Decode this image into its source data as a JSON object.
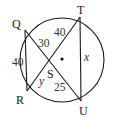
{
  "diagram": {
    "type": "circle-intersecting-chords",
    "circle": {
      "cx": 62,
      "cy": 60,
      "r": 42
    },
    "center_dot": {
      "x": 62,
      "y": 59
    },
    "points": {
      "Q": {
        "label": "Q",
        "x": 25,
        "y": 30
      },
      "T": {
        "label": "T",
        "x": 80,
        "y": 17
      },
      "R": {
        "label": "R",
        "x": 27,
        "y": 91
      },
      "U": {
        "label": "U",
        "x": 81,
        "y": 101
      },
      "S": {
        "label": "S",
        "x": 50,
        "y": 59
      }
    },
    "segments": [
      {
        "from": "Q",
        "to": "U"
      },
      {
        "from": "R",
        "to": "T"
      },
      {
        "from": "Q",
        "to": "R"
      },
      {
        "from": "T",
        "to": "U"
      }
    ],
    "measures": {
      "QR": "40",
      "QS": "30",
      "ST": "40",
      "TU": "x",
      "RS": "y",
      "SU": "25"
    }
  }
}
